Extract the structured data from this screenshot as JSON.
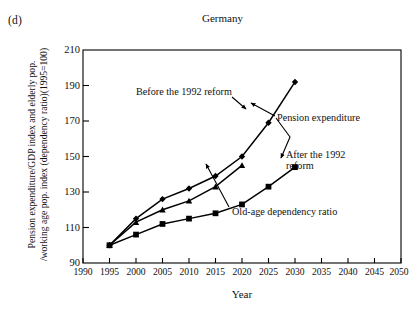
{
  "figure": {
    "panel_label": "(d)",
    "title": "Germany"
  },
  "axes": {
    "y_title_line1": "Pension expenditure/GDP index and elderly pop.",
    "y_title_line2": "/working age pop. index (dependency ratio)(1995=100)",
    "x_title": "Year"
  },
  "annotations": {
    "before_reform": "Before the 1992 reform",
    "pension_expenditure": "Pension expenditure",
    "after_reform_line1": "After the 1992",
    "after_reform_line2": "reform",
    "old_age_ratio": "Old-age dependency ratio"
  },
  "chart_data": {
    "type": "line",
    "title": "Germany",
    "xlabel": "Year",
    "ylabel": "Pension expenditure/GDP index and elderly pop. /working age pop. index (dependency ratio)(1995=100)",
    "xlim": [
      1990,
      2050
    ],
    "ylim": [
      90,
      210
    ],
    "xticks": [
      1990,
      1995,
      2000,
      2005,
      2010,
      2015,
      2020,
      2025,
      2030,
      2035,
      2040,
      2045,
      2050
    ],
    "yticks": [
      90,
      110,
      130,
      150,
      170,
      190,
      210
    ],
    "grid": false,
    "legend": "annotations",
    "series": [
      {
        "name": "Pension expenditure, before the 1992 reform",
        "marker": "diamond",
        "x": [
          1995,
          2000,
          2005,
          2010,
          2015,
          2020,
          2025,
          2030
        ],
        "values": [
          100,
          115,
          126,
          132,
          139,
          150,
          169,
          192
        ]
      },
      {
        "name": "Old-age dependency ratio",
        "marker": "triangle",
        "x": [
          1995,
          2000,
          2005,
          2010,
          2015,
          2020
        ],
        "values": [
          100,
          113,
          120,
          125,
          133,
          145
        ]
      },
      {
        "name": "Pension expenditure, after the 1992 reform",
        "marker": "square",
        "x": [
          1995,
          2000,
          2005,
          2010,
          2015,
          2020,
          2025,
          2030
        ],
        "values": [
          100,
          106,
          112,
          115,
          118,
          123,
          133,
          144
        ]
      }
    ]
  }
}
